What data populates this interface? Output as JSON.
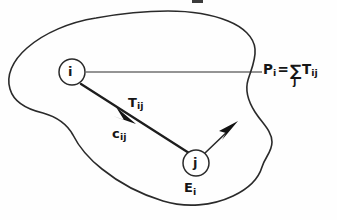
{
  "figure": {
    "background_color": "#fefefe",
    "ink_color": "#2a2a2a",
    "width": 337,
    "height": 220
  },
  "nodes": [
    {
      "id": "i",
      "label": "i",
      "cx": 72,
      "cy": 72,
      "r": 13
    },
    {
      "id": "j",
      "label": "j",
      "cx": 196,
      "cy": 163,
      "r": 13
    }
  ],
  "labels": {
    "pi": {
      "name": "P",
      "subscript": "i",
      "equals": "=",
      "sigma": "∑",
      "sigma_index": "j",
      "term": "T",
      "term_subscript": "ij",
      "full_text": "Pi = ∑j Tij"
    },
    "tij": {
      "symbol": "T",
      "subscript": "ij",
      "full_text": "Tij"
    },
    "cij": {
      "symbol": "c",
      "subscript": "ij",
      "full_text": "cij"
    },
    "ei": {
      "symbol": "E",
      "subscript": "i",
      "full_text": "Ei"
    }
  },
  "edges": [
    {
      "id": "i-to-j-flow",
      "from": "i",
      "to": "j",
      "style": "solid-thick-with-arrowhead",
      "arrow_at": {
        "x": 131,
        "y": 121
      }
    },
    {
      "id": "i-horizontal-outflow",
      "from": "i",
      "to": "region-boundary",
      "style": "thin-horizontal",
      "end": {
        "x": 262,
        "y": 72
      }
    },
    {
      "id": "j-external-arrow",
      "from": "j",
      "to": "external",
      "style": "thin-with-arrowhead",
      "arrow_at": {
        "x": 233,
        "y": 126
      }
    }
  ],
  "region": {
    "name": "study-area-boundary",
    "shape": "irregular-closed-blob"
  }
}
